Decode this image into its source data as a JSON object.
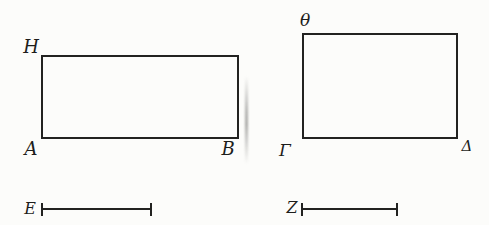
{
  "figure": {
    "description_colors": {
      "paper": "#fcfcfa",
      "ink": "#222220"
    },
    "left_rectangle": {
      "top_left_label": "H",
      "bottom_left_label": "A",
      "bottom_right_label": "B"
    },
    "right_rectangle": {
      "top_left_label": "θ",
      "bottom_left_label": "Γ",
      "bottom_right_label": "Δ"
    },
    "segment_e": {
      "label": "E"
    },
    "segment_z": {
      "label": "Z"
    }
  }
}
